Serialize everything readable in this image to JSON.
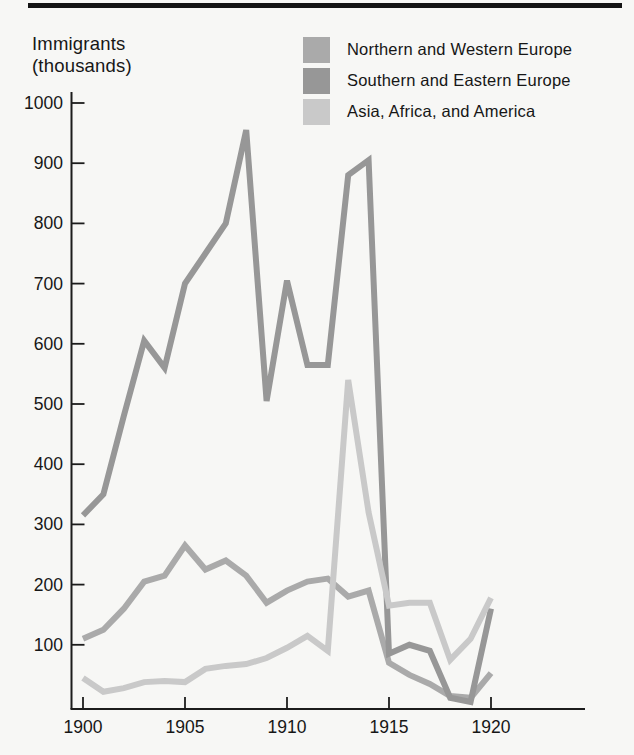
{
  "page": {
    "background": "#f7f7f5",
    "top_rule_color": "#141414"
  },
  "chart_data": {
    "type": "line",
    "title": "",
    "ylabel": "Immigrants (thousands)",
    "ylabel_line1": "Immigrants",
    "ylabel_line2": "(thousands)",
    "xlabel": "",
    "x": [
      1900,
      1901,
      1902,
      1903,
      1904,
      1905,
      1906,
      1907,
      1908,
      1909,
      1910,
      1911,
      1912,
      1913,
      1914,
      1915,
      1916,
      1917,
      1918,
      1919,
      1920
    ],
    "x_tick_labels": [
      "1900",
      "1905",
      "1910",
      "1915",
      "1920"
    ],
    "y_ticks": [
      100,
      200,
      300,
      400,
      500,
      600,
      700,
      800,
      900,
      1000
    ],
    "ylim": [
      0,
      1020
    ],
    "xlim": [
      1900,
      1924.5
    ],
    "grid": false,
    "legend_position": "top-right",
    "axis_color": "#1c1c1c",
    "series": [
      {
        "name": "Northern and Western Europe",
        "color": "#aaaaaa",
        "values": [
          110,
          125,
          160,
          205,
          215,
          265,
          225,
          240,
          215,
          170,
          190,
          205,
          210,
          180,
          190,
          70,
          50,
          35,
          15,
          12,
          53
        ]
      },
      {
        "name": "Southern and Eastern Europe",
        "color": "#979797",
        "values": [
          315,
          350,
          480,
          605,
          560,
          700,
          750,
          800,
          955,
          505,
          705,
          565,
          565,
          880,
          905,
          85,
          100,
          90,
          12,
          5,
          160
        ]
      },
      {
        "name": "Asia, Africa, and America",
        "color": "#c9c9c9",
        "values": [
          45,
          22,
          28,
          38,
          40,
          38,
          60,
          65,
          68,
          78,
          95,
          115,
          90,
          540,
          320,
          165,
          170,
          170,
          75,
          110,
          178
        ]
      }
    ]
  }
}
